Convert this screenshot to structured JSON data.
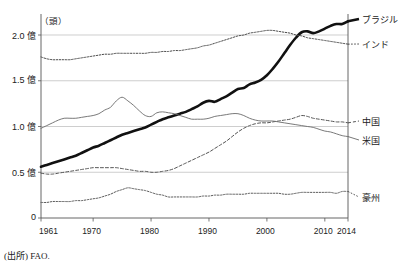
{
  "figure": {
    "top_caption": "",
    "source_note": "(出所) FAO.",
    "unit_label": "（頭）"
  },
  "axis": {
    "y_ticks": [
      "2.0 億",
      "1.5 億",
      "1.0 億",
      "0.5 億",
      "0"
    ],
    "x_ticks": [
      "1961",
      "1970",
      "1980",
      "1990",
      "2000",
      "2010",
      "2014"
    ]
  },
  "series_labels": {
    "brazil": "ブラジル",
    "india": "インド",
    "china": "中国",
    "usa": "米国",
    "australia": "豪州"
  },
  "chart_data": {
    "type": "line",
    "title": "",
    "xlabel": "",
    "ylabel": "（頭）",
    "xlim": [
      1961,
      2014
    ],
    "ylim": [
      0,
      2.25
    ],
    "y_unit": "億頭",
    "grid": true,
    "grid_values": [
      0.5,
      1.0,
      1.5,
      2.0
    ],
    "legend": "right-inline",
    "x": [
      1961,
      1962,
      1963,
      1964,
      1965,
      1966,
      1967,
      1968,
      1969,
      1970,
      1971,
      1972,
      1973,
      1974,
      1975,
      1976,
      1977,
      1978,
      1979,
      1980,
      1981,
      1982,
      1983,
      1984,
      1985,
      1986,
      1987,
      1988,
      1989,
      1990,
      1991,
      1992,
      1993,
      1994,
      1995,
      1996,
      1997,
      1998,
      1999,
      2000,
      2001,
      2002,
      2003,
      2004,
      2005,
      2006,
      2007,
      2008,
      2009,
      2010,
      2011,
      2012,
      2013,
      2014
    ],
    "series": [
      {
        "name": "ブラジル",
        "style": "thick-solid",
        "color": "#111111",
        "values": [
          0.56,
          0.58,
          0.6,
          0.62,
          0.64,
          0.66,
          0.68,
          0.71,
          0.74,
          0.77,
          0.79,
          0.82,
          0.85,
          0.88,
          0.91,
          0.93,
          0.95,
          0.97,
          0.99,
          1.02,
          1.05,
          1.08,
          1.1,
          1.12,
          1.14,
          1.16,
          1.19,
          1.22,
          1.26,
          1.28,
          1.27,
          1.3,
          1.33,
          1.37,
          1.41,
          1.42,
          1.46,
          1.48,
          1.51,
          1.56,
          1.63,
          1.71,
          1.8,
          1.89,
          1.97,
          2.03,
          2.04,
          2.02,
          2.04,
          2.07,
          2.1,
          2.12,
          2.12,
          2.15
        ]
      },
      {
        "name": "インド",
        "style": "dotted",
        "color": "#4a4a4a",
        "values": [
          1.76,
          1.74,
          1.73,
          1.73,
          1.73,
          1.73,
          1.74,
          1.75,
          1.76,
          1.77,
          1.78,
          1.79,
          1.79,
          1.8,
          1.8,
          1.8,
          1.8,
          1.8,
          1.8,
          1.81,
          1.81,
          1.82,
          1.82,
          1.83,
          1.83,
          1.84,
          1.85,
          1.86,
          1.88,
          1.89,
          1.91,
          1.93,
          1.95,
          1.97,
          1.99,
          2.0,
          2.02,
          2.03,
          2.04,
          2.05,
          2.05,
          2.04,
          2.03,
          2.02,
          2.0,
          1.99,
          1.97,
          1.96,
          1.95,
          1.94,
          1.93,
          1.92,
          1.91,
          1.9
        ]
      },
      {
        "name": "中国",
        "style": "dashed",
        "color": "#555555",
        "values": [
          0.49,
          0.48,
          0.48,
          0.49,
          0.5,
          0.51,
          0.52,
          0.53,
          0.54,
          0.55,
          0.55,
          0.55,
          0.55,
          0.55,
          0.54,
          0.53,
          0.52,
          0.51,
          0.51,
          0.5,
          0.5,
          0.51,
          0.52,
          0.54,
          0.57,
          0.6,
          0.63,
          0.66,
          0.69,
          0.72,
          0.76,
          0.8,
          0.84,
          0.89,
          0.94,
          0.98,
          1.01,
          1.03,
          1.04,
          1.04,
          1.05,
          1.06,
          1.07,
          1.08,
          1.1,
          1.12,
          1.11,
          1.09,
          1.08,
          1.07,
          1.06,
          1.05,
          1.05,
          1.04
        ]
      },
      {
        "name": "米国",
        "style": "thin-solid",
        "color": "#6a6a6a",
        "values": [
          0.98,
          1.01,
          1.04,
          1.07,
          1.09,
          1.09,
          1.09,
          1.1,
          1.11,
          1.12,
          1.14,
          1.18,
          1.21,
          1.28,
          1.32,
          1.28,
          1.23,
          1.17,
          1.12,
          1.11,
          1.15,
          1.16,
          1.15,
          1.14,
          1.12,
          1.1,
          1.08,
          1.08,
          1.08,
          1.09,
          1.11,
          1.12,
          1.13,
          1.14,
          1.14,
          1.12,
          1.09,
          1.07,
          1.06,
          1.06,
          1.06,
          1.05,
          1.04,
          1.03,
          1.02,
          1.01,
          1.0,
          0.99,
          0.97,
          0.95,
          0.94,
          0.92,
          0.9,
          0.89
        ]
      },
      {
        "name": "豪州",
        "style": "dotted",
        "color": "#5a5a5a",
        "values": [
          0.17,
          0.17,
          0.18,
          0.18,
          0.18,
          0.18,
          0.19,
          0.19,
          0.2,
          0.21,
          0.22,
          0.24,
          0.26,
          0.29,
          0.31,
          0.33,
          0.32,
          0.31,
          0.3,
          0.28,
          0.26,
          0.25,
          0.23,
          0.23,
          0.23,
          0.23,
          0.23,
          0.23,
          0.24,
          0.24,
          0.25,
          0.25,
          0.26,
          0.26,
          0.26,
          0.26,
          0.27,
          0.27,
          0.27,
          0.27,
          0.27,
          0.27,
          0.26,
          0.26,
          0.27,
          0.28,
          0.28,
          0.28,
          0.28,
          0.28,
          0.28,
          0.27,
          0.29,
          0.29
        ]
      }
    ]
  }
}
